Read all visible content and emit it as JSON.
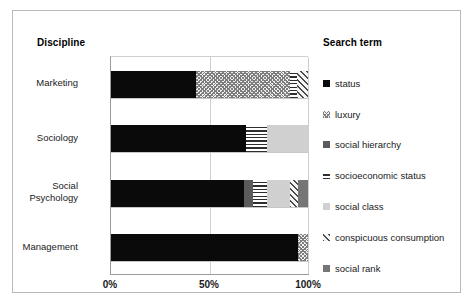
{
  "frame": {
    "discipline_heading": "Discipline",
    "searchterm_heading": "Search term"
  },
  "axis": {
    "ticks": [
      "0%",
      "50%",
      "100%"
    ],
    "tick_values": [
      0,
      50,
      100
    ]
  },
  "legend": {
    "title": "Search term",
    "items": [
      {
        "label": "status",
        "swatch": "fill-status",
        "color": "#0a0a0a"
      },
      {
        "label": "luxury",
        "swatch": "fill-luxury",
        "color": "#f0f0f0"
      },
      {
        "label": "social hierarchy",
        "swatch": "fill-social-hierarchy",
        "color": "#5b5b5b"
      },
      {
        "label": "socioeconomic status",
        "swatch": "fill-socioeconomic-status",
        "color": "#ffffff"
      },
      {
        "label": "social class",
        "swatch": "fill-social-class",
        "color": "#d0d0d0"
      },
      {
        "label": "conspicuous consumption",
        "swatch": "fill-conspicuous-consumption",
        "color": "#f4f4f4"
      },
      {
        "label": "social rank",
        "swatch": "fill-social-rank",
        "color": "#757575"
      }
    ]
  },
  "chart_data": {
    "type": "bar",
    "orientation": "horizontal",
    "stacked": true,
    "stack_total": 100,
    "title": "",
    "xlabel": "",
    "ylabel": "Discipline",
    "xlim": [
      0,
      100
    ],
    "xticks": [
      0,
      50,
      100
    ],
    "xticklabels": [
      "0%",
      "50%",
      "100%"
    ],
    "grid": true,
    "legend_position": "right",
    "legend_title": "Search term",
    "categories": [
      "Marketing",
      "Sociology",
      "Social Psychology",
      "Management"
    ],
    "series": [
      {
        "name": "status",
        "values": [
          43.4,
          68.7,
          67.7,
          95.0
        ]
      },
      {
        "name": "luxury",
        "values": [
          47.5,
          0.0,
          0.0,
          5.0
        ]
      },
      {
        "name": "social hierarchy",
        "values": [
          0.0,
          0.0,
          4.5,
          0.0
        ]
      },
      {
        "name": "socioeconomic status",
        "values": [
          3.5,
          10.6,
          7.1,
          0.0
        ]
      },
      {
        "name": "social class",
        "values": [
          0.0,
          20.7,
          11.6,
          0.0
        ]
      },
      {
        "name": "conspicuous consumption",
        "values": [
          5.6,
          0.0,
          4.0,
          0.0
        ]
      },
      {
        "name": "social rank",
        "values": [
          0.0,
          0.0,
          5.1,
          0.0
        ]
      }
    ]
  },
  "bars": [
    {
      "category": "Marketing",
      "segments": [
        {
          "name": "status",
          "fill": "fill-status",
          "pct": 43.4
        },
        {
          "name": "luxury",
          "fill": "fill-luxury",
          "pct": 47.5
        },
        {
          "name": "socioeconomic status",
          "fill": "fill-socioeconomic-status",
          "pct": 3.5
        },
        {
          "name": "conspicuous consumption",
          "fill": "fill-conspicuous-consumption",
          "pct": 5.6
        }
      ]
    },
    {
      "category": "Sociology",
      "segments": [
        {
          "name": "status",
          "fill": "fill-status",
          "pct": 68.7
        },
        {
          "name": "socioeconomic status",
          "fill": "fill-socioeconomic-status",
          "pct": 10.6
        },
        {
          "name": "social class",
          "fill": "fill-social-class",
          "pct": 20.7
        }
      ]
    },
    {
      "category": "Social\nPsychology",
      "segments": [
        {
          "name": "status",
          "fill": "fill-status",
          "pct": 67.7
        },
        {
          "name": "social hierarchy",
          "fill": "fill-social-hierarchy",
          "pct": 4.5
        },
        {
          "name": "socioeconomic status",
          "fill": "fill-socioeconomic-status",
          "pct": 7.1
        },
        {
          "name": "social class",
          "fill": "fill-social-class",
          "pct": 11.6
        },
        {
          "name": "conspicuous consumption",
          "fill": "fill-conspicuous-consumption",
          "pct": 4.0
        },
        {
          "name": "social rank",
          "fill": "fill-social-rank",
          "pct": 5.1
        }
      ]
    },
    {
      "category": "Management",
      "segments": [
        {
          "name": "status",
          "fill": "fill-status",
          "pct": 95.0
        },
        {
          "name": "luxury",
          "fill": "fill-luxury",
          "pct": 5.0
        }
      ]
    }
  ]
}
